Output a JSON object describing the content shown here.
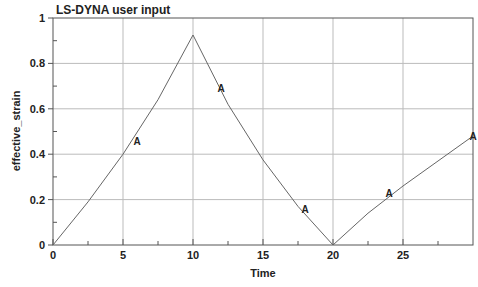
{
  "chart_data": {
    "type": "line",
    "title": "LS-DYNA user input",
    "xlabel": "Time",
    "ylabel": "effective_strain",
    "xlim": [
      0,
      30
    ],
    "ylim": [
      0,
      1
    ],
    "xticks": [
      0,
      5,
      10,
      15,
      20,
      25
    ],
    "yticks": [
      0,
      0.2,
      0.4,
      0.6,
      0.8,
      1
    ],
    "ytick_labels": [
      "0",
      "0.2",
      "0.4",
      "0.6",
      "0.8",
      "1"
    ],
    "grid": true,
    "legend": null,
    "series": [
      {
        "name": "A",
        "marker_label": "A",
        "x": [
          0,
          2.5,
          5,
          7.5,
          10,
          12.5,
          15,
          17.5,
          20,
          22.5,
          25,
          27.5,
          30
        ],
        "y": [
          0,
          0.19,
          0.4,
          0.64,
          0.925,
          0.62,
          0.375,
          0.17,
          0,
          0.14,
          0.26,
          0.37,
          0.48
        ],
        "markers": [
          {
            "x": 6,
            "y": 0.46
          },
          {
            "x": 12,
            "y": 0.69
          },
          {
            "x": 18,
            "y": 0.16
          },
          {
            "x": 24,
            "y": 0.23
          },
          {
            "x": 30,
            "y": 0.48
          }
        ]
      }
    ]
  }
}
